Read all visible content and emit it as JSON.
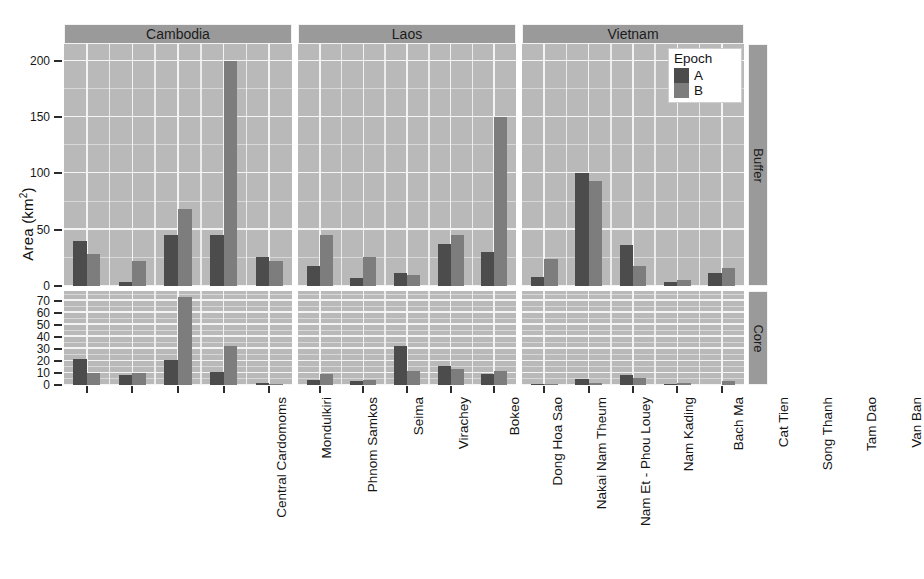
{
  "axis": {
    "y_title": "Area (km",
    "y_title_sup": "2",
    "y_title_tail": ")"
  },
  "legend": {
    "title": "Epoch",
    "entries": [
      {
        "label": "A",
        "color": "#4c4c4c"
      },
      {
        "label": "B",
        "color": "#7d7d7d"
      }
    ]
  },
  "row_strips": [
    "Buffer",
    "Core"
  ],
  "col_strips": [
    "Cambodia",
    "Laos",
    "Vietnam"
  ],
  "buffer_ticks": [
    "0",
    "50",
    "100",
    "150",
    "200"
  ],
  "core_ticks": [
    "0",
    "10",
    "20",
    "30",
    "40",
    "50",
    "60",
    "70"
  ],
  "sites": {
    "Cambodia": [
      "Central Cardomoms",
      "Mondulkiri",
      "Phnom Samkos",
      "Seima",
      "Virachey"
    ],
    "Laos": [
      "Bokeo",
      "Dong Hoa Sao",
      "Nakai Nam Theum",
      "Nam Et - Phou Louey",
      "Nam Kading"
    ],
    "Vietnam": [
      "Bach Ma",
      "Cat Tien",
      "Song Thanh",
      "Tam Dao",
      "Van Ban"
    ]
  },
  "chart_data": {
    "type": "bar",
    "title": "",
    "xlabel": "",
    "ylabel": "Area (km²)",
    "grid": true,
    "legend_position": "top-right-inside",
    "facet_cols": [
      "Cambodia",
      "Laos",
      "Vietnam"
    ],
    "facet_rows": [
      "Buffer",
      "Core"
    ],
    "series": [
      {
        "name": "A",
        "color": "#4c4c4c"
      },
      {
        "name": "B",
        "color": "#7d7d7d"
      }
    ],
    "panels": [
      {
        "row": "Buffer",
        "col": "Cambodia",
        "ylim": [
          0,
          215
        ],
        "yticks": [
          0,
          50,
          100,
          150,
          200
        ],
        "categories": [
          "Central Cardomoms",
          "Mondulkiri",
          "Phnom Samkos",
          "Seima",
          "Virachey"
        ],
        "A": [
          40,
          4,
          45,
          45,
          26
        ],
        "B": [
          28,
          22,
          68,
          200,
          22
        ]
      },
      {
        "row": "Buffer",
        "col": "Laos",
        "ylim": [
          0,
          215
        ],
        "yticks": [
          0,
          50,
          100,
          150,
          200
        ],
        "categories": [
          "Bokeo",
          "Dong Hoa Sao",
          "Nakai Nam Theum",
          "Nam Et - Phou Louey",
          "Nam Kading"
        ],
        "A": [
          18,
          7,
          12,
          37,
          30
        ],
        "B": [
          45,
          26,
          10,
          45,
          150
        ]
      },
      {
        "row": "Buffer",
        "col": "Vietnam",
        "ylim": [
          0,
          215
        ],
        "yticks": [
          0,
          50,
          100,
          150,
          200
        ],
        "categories": [
          "Bach Ma",
          "Cat Tien",
          "Song Thanh",
          "Tam Dao",
          "Van Ban"
        ],
        "A": [
          8,
          100,
          36,
          4,
          12
        ],
        "B": [
          24,
          93,
          18,
          5,
          16
        ]
      },
      {
        "row": "Core",
        "col": "Cambodia",
        "ylim": [
          0,
          78
        ],
        "yticks": [
          0,
          10,
          20,
          30,
          40,
          50,
          60,
          70
        ],
        "categories": [
          "Central Cardomoms",
          "Mondulkiri",
          "Phnom Samkos",
          "Seima",
          "Virachey"
        ],
        "A": [
          22,
          8,
          21,
          11,
          2
        ],
        "B": [
          10,
          10,
          73,
          32,
          1
        ]
      },
      {
        "row": "Core",
        "col": "Laos",
        "ylim": [
          0,
          78
        ],
        "yticks": [
          0,
          10,
          20,
          30,
          40,
          50,
          60,
          70
        ],
        "categories": [
          "Bokeo",
          "Dong Hoa Sao",
          "Nakai Nam Theum",
          "Nam Et - Phou Louey",
          "Nam Kading"
        ],
        "A": [
          4,
          3,
          32,
          16,
          9
        ],
        "B": [
          9,
          4,
          12,
          13,
          12
        ]
      },
      {
        "row": "Core",
        "col": "Vietnam",
        "ylim": [
          0,
          78
        ],
        "yticks": [
          0,
          10,
          20,
          30,
          40,
          50,
          60,
          70
        ],
        "categories": [
          "Bach Ma",
          "Cat Tien",
          "Song Thanh",
          "Tam Dao",
          "Van Ban"
        ],
        "A": [
          1,
          5,
          8,
          0.5,
          0
        ],
        "B": [
          0.5,
          2,
          6,
          2,
          3
        ]
      }
    ]
  }
}
